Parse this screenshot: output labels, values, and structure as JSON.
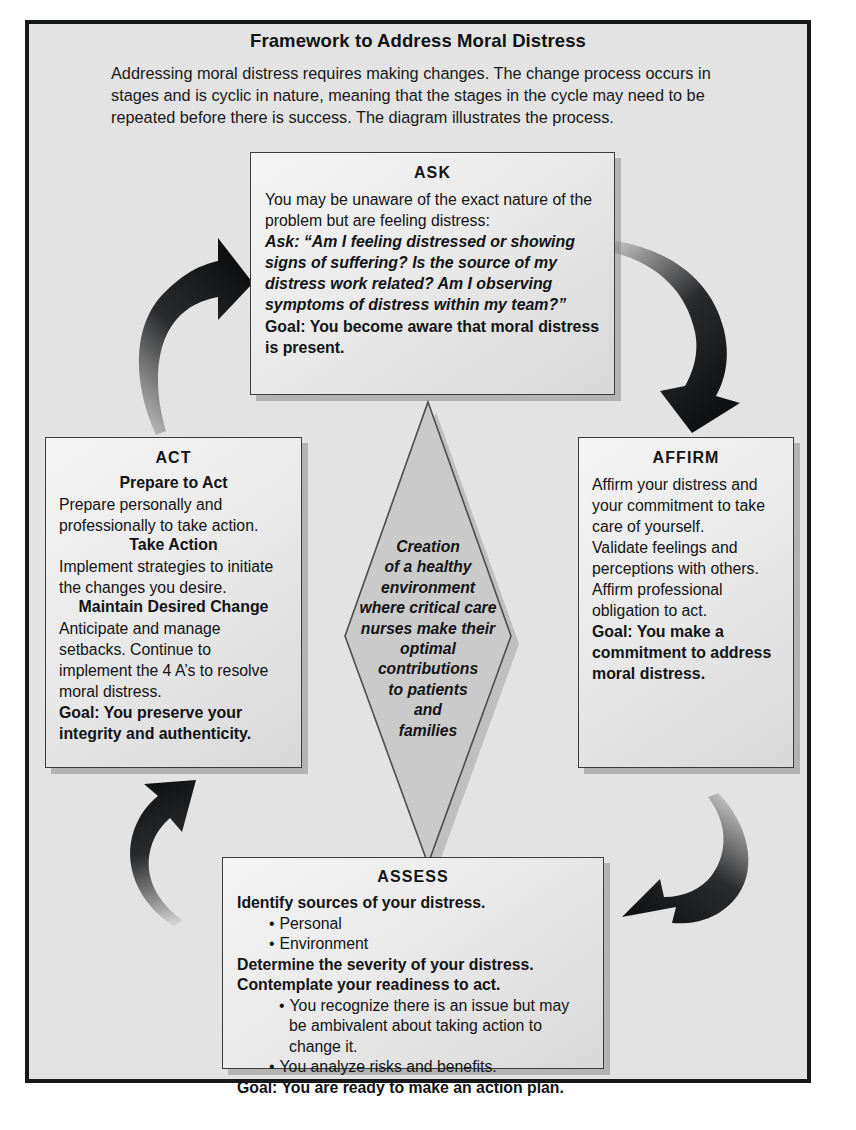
{
  "header": {
    "title": "Framework to Address Moral Distress",
    "intro": "Addressing moral distress requires making changes. The change process occurs in stages and is cyclic in nature, meaning that the stages in the cycle may need to be repeated before there is success. The diagram illustrates the process."
  },
  "nodes": {
    "ask": {
      "title": "ASK",
      "para1": "You may be unaware of the exact nature of the problem but are feeling distress:",
      "quote": "Ask: “Am I feeling distressed or showing signs of suffering? Is the source of my distress work related? Am I observing symptoms of distress within my team?”",
      "goal": "Goal: You become aware that moral distress is present."
    },
    "affirm": {
      "title": "AFFIRM",
      "para1": "Affirm your distress and your commitment to take care of yourself.",
      "para2": "Validate feelings and perceptions with others.",
      "para3": "Affirm professional obligation to act.",
      "goal": "Goal: You make a commitment to address  moral distress."
    },
    "assess": {
      "title": "ASSESS",
      "line1": "Identify sources of your distress.",
      "bullet1": "Personal",
      "bullet2": "Environment",
      "line2": "Determine the severity of your distress.",
      "line3": "Contemplate your readiness to act.",
      "bullet3": "You recognize there is an issue but may be ambivalent about taking action to change it.",
      "bullet4": "You analyze risks and benefits.",
      "goal": "Goal: You are ready to make an action plan."
    },
    "act": {
      "title": "ACT",
      "sub1": "Prepare to Act",
      "para1": "Prepare personally and professionally to take action.",
      "sub2": "Take Action",
      "para2": "Implement strategies to initiate the changes you desire.",
      "sub3": "Maintain Desired Change",
      "para3": "Anticipate and manage setbacks. Continue to implement the 4 A’s to resolve moral distress.",
      "goal": "Goal: You preserve your integrity and authenticity."
    },
    "center": {
      "text": "Creation of a healthy environment where critical care nurses make their optimal contributions to patients and families",
      "lines": [
        "Creation",
        "of a healthy",
        "environment",
        "where critical care",
        "nurses make their",
        "optimal",
        "contributions",
        "to patients",
        "and",
        "families"
      ]
    }
  },
  "arrows": {
    "act_to_ask": "curved-arrow-up-right",
    "ask_to_affirm": "curved-arrow-down-right",
    "affirm_to_assess": "curved-arrow-down-left",
    "assess_to_act": "curved-arrow-up-left"
  },
  "bullet_glyph": "•",
  "colors": {
    "panel_background": "#e3e3e3",
    "frame_border": "#17181a",
    "box_fill_light": "#f4f4f4",
    "box_fill_dark": "#d8d8d8",
    "box_border": "#3b3d3f",
    "diamond_fill": "#c9c9c9",
    "shadow": "#999999",
    "text": "#121315"
  }
}
